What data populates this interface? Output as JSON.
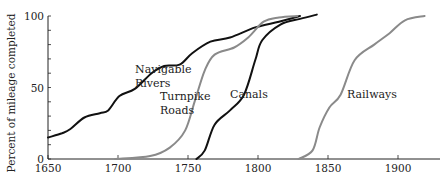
{
  "chart_data": {
    "type": "line",
    "title": "",
    "xlabel": "",
    "ylabel": "Percent of mileage completed",
    "xlim": [
      1650,
      1930
    ],
    "ylim": [
      0,
      100
    ],
    "xticks": [
      1650,
      1700,
      1750,
      1800,
      1850,
      1900
    ],
    "yticks": [
      0,
      50,
      100
    ],
    "y_minor_tick_step": 10,
    "grid": false,
    "legend": "none (inline curve annotations)",
    "series": [
      {
        "name": "Navigable Rivers",
        "label_lines": [
          "Navigable",
          "Rivers"
        ],
        "color": "#111111",
        "x": [
          1650,
          1660,
          1666,
          1676,
          1687,
          1693,
          1701,
          1712,
          1724,
          1733,
          1744,
          1753,
          1766,
          1780,
          1798,
          1815,
          1830
        ],
        "y": [
          15,
          18,
          21,
          29,
          32,
          34,
          44,
          49,
          60,
          65,
          66,
          74,
          82,
          85,
          92,
          96,
          100
        ]
      },
      {
        "name": "Turnpike Roads",
        "label_lines": [
          "Turnpike",
          "Roads"
        ],
        "color": "#8a8a8a",
        "x": [
          1698,
          1723,
          1737,
          1748,
          1755,
          1762,
          1769,
          1783,
          1793,
          1804,
          1815,
          1828
        ],
        "y": [
          0,
          2,
          8,
          20,
          41,
          62,
          73,
          78,
          85,
          96,
          99,
          100
        ]
      },
      {
        "name": "Canals",
        "label_lines": [
          "Canals"
        ],
        "color": "#111111",
        "x": [
          1756,
          1762,
          1769,
          1780,
          1790,
          1798,
          1803,
          1816,
          1830,
          1842
        ],
        "y": [
          0,
          6,
          24,
          34,
          45,
          69,
          83,
          94,
          98,
          101
        ]
      },
      {
        "name": "Railways",
        "label_lines": [
          "Railways"
        ],
        "color": "#8a8a8a",
        "x": [
          1829,
          1839,
          1844,
          1851,
          1859,
          1869,
          1883,
          1894,
          1905,
          1919
        ],
        "y": [
          0,
          6,
          22,
          36,
          45,
          69,
          80,
          88,
          97,
          100
        ]
      }
    ]
  }
}
